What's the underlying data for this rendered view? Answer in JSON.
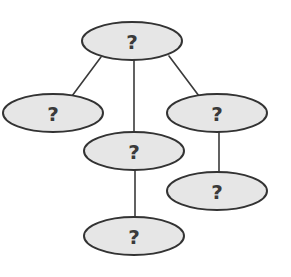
{
  "diagram": {
    "type": "tree",
    "colors": {
      "node_fill": "#e6e6e6",
      "node_stroke": "#333333",
      "edge_stroke": "#3a3a3a",
      "label_color": "#3a3a3a",
      "background": "#ffffff"
    },
    "nodes": [
      {
        "id": "root",
        "label": "?",
        "cx": 132,
        "cy": 41,
        "rx": 50,
        "ry": 19
      },
      {
        "id": "left",
        "label": "?",
        "cx": 53,
        "cy": 113,
        "rx": 50,
        "ry": 19
      },
      {
        "id": "right",
        "label": "?",
        "cx": 217,
        "cy": 113,
        "rx": 50,
        "ry": 19
      },
      {
        "id": "middle",
        "label": "?",
        "cx": 134,
        "cy": 151,
        "rx": 50,
        "ry": 19
      },
      {
        "id": "right-child",
        "label": "?",
        "cx": 217,
        "cy": 191,
        "rx": 50,
        "ry": 19
      },
      {
        "id": "bottom",
        "label": "?",
        "cx": 134,
        "cy": 236,
        "rx": 50,
        "ry": 19
      }
    ],
    "edges": [
      {
        "from": "root",
        "to": "left",
        "x1": 101,
        "y1": 57,
        "x2": 72,
        "y2": 96
      },
      {
        "from": "root",
        "to": "middle",
        "x1": 134,
        "y1": 60,
        "x2": 134,
        "y2": 132
      },
      {
        "from": "root",
        "to": "right",
        "x1": 169,
        "y1": 56,
        "x2": 199,
        "y2": 96
      },
      {
        "from": "right",
        "to": "right-child",
        "x1": 219,
        "y1": 132,
        "x2": 219,
        "y2": 172
      },
      {
        "from": "middle",
        "to": "bottom",
        "x1": 135,
        "y1": 170,
        "x2": 135,
        "y2": 217
      }
    ]
  }
}
